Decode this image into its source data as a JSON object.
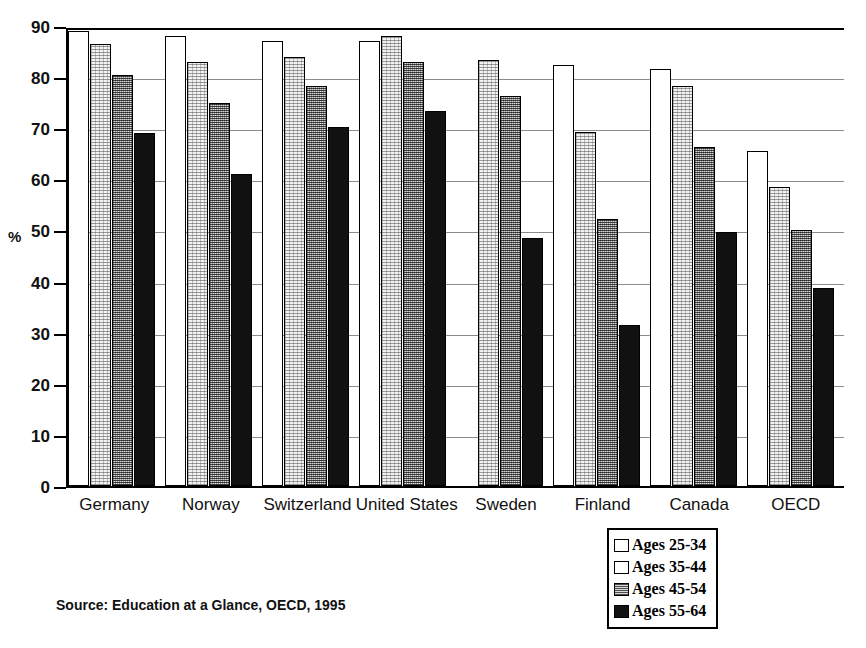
{
  "chart_data": {
    "type": "bar",
    "title": "",
    "xlabel": "",
    "ylabel": "%",
    "ylim": [
      0,
      90
    ],
    "yticks": [
      0,
      10,
      20,
      30,
      40,
      50,
      60,
      70,
      80,
      90
    ],
    "grid": true,
    "legend_position": "bottom-right",
    "categories": [
      "Germany",
      "Norway",
      "Switzerland",
      "United States",
      "Sweden",
      "Finland",
      "Canada",
      "OECD"
    ],
    "series": [
      {
        "name": "Ages 25-34",
        "values": [
          89.0,
          88.0,
          87.0,
          87.0,
          null,
          82.3,
          81.5,
          65.5
        ]
      },
      {
        "name": "Ages 35-44",
        "values": [
          86.5,
          83.0,
          84.0,
          88.0,
          83.3,
          69.3,
          78.3,
          58.5
        ]
      },
      {
        "name": "Ages 45-54",
        "values": [
          80.5,
          75.0,
          78.3,
          83.0,
          76.3,
          52.3,
          66.3,
          50.0
        ]
      },
      {
        "name": "Ages 55-64",
        "values": [
          69.0,
          61.0,
          70.3,
          73.3,
          48.5,
          31.5,
          49.7,
          38.8
        ]
      }
    ],
    "source": "Source:  Education at a Glance, OECD, 1995"
  },
  "axis": {
    "y_title": "%"
  },
  "legend": {
    "items": [
      {
        "label": "Ages 25-34"
      },
      {
        "label": "Ages 35-44"
      },
      {
        "label": "Ages 45-54"
      },
      {
        "label": "Ages 55-64"
      }
    ]
  },
  "footer": {
    "source": "Source:  Education at a Glance, OECD, 1995"
  }
}
